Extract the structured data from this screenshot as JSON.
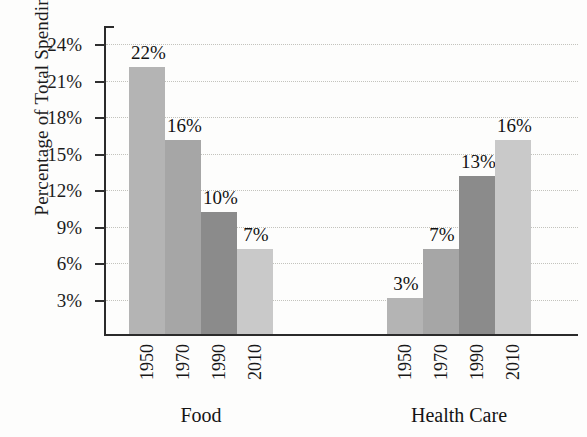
{
  "chart_data": {
    "type": "bar",
    "title": "",
    "subtitle": "",
    "xlabel": "",
    "ylabel": "Percentage of Total Spending",
    "ylim": [
      0,
      25.5
    ],
    "ytick_labels": [
      "24%",
      "21%",
      "18%",
      "15%",
      "12%",
      "9%",
      "6%",
      "3%"
    ],
    "ytick_values": [
      24,
      21,
      18,
      15,
      12,
      9,
      6,
      3
    ],
    "grid": "horizontal-dotted",
    "legend": "none",
    "categories": [
      "Food",
      "Health Care"
    ],
    "series": [
      {
        "name": "1950",
        "values": [
          22,
          3
        ],
        "color": "#b4b4b4"
      },
      {
        "name": "1970",
        "values": [
          16,
          7
        ],
        "color": "#a6a6a6"
      },
      {
        "name": "1990",
        "values": [
          10,
          13
        ],
        "color": "#8b8b8b"
      },
      {
        "name": "2010",
        "values": [
          7,
          16
        ],
        "color": "#c9c9c9"
      }
    ],
    "groups": [
      {
        "label": "Food",
        "bars": [
          {
            "year": "1950",
            "value": 22,
            "value_label": "22%",
            "color": "#b4b4b4"
          },
          {
            "year": "1970",
            "value": 16,
            "value_label": "16%",
            "color": "#a6a6a6"
          },
          {
            "year": "1990",
            "value": 10,
            "value_label": "10%",
            "color": "#8b8b8b"
          },
          {
            "year": "2010",
            "value": 7,
            "value_label": "7%",
            "color": "#c9c9c9"
          }
        ]
      },
      {
        "label": "Health Care",
        "bars": [
          {
            "year": "1950",
            "value": 3,
            "value_label": "3%",
            "color": "#b4b4b4"
          },
          {
            "year": "1970",
            "value": 7,
            "value_label": "7%",
            "color": "#a6a6a6"
          },
          {
            "year": "1990",
            "value": 13,
            "value_label": "13%",
            "color": "#8b8b8b"
          },
          {
            "year": "2010",
            "value": 16,
            "value_label": "16%",
            "color": "#c9c9c9"
          }
        ]
      }
    ]
  },
  "axis": {
    "y_title": "Percentage of Total Spending"
  }
}
